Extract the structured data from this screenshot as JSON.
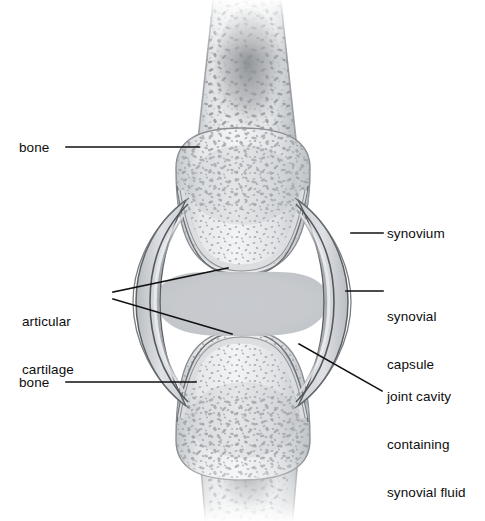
{
  "figure": {
    "background_color": "#ffffff",
    "ink_color": "#111111",
    "bone_fill": "#e8e9ea",
    "bone_outline": "#8d9093",
    "cartilage_fill": "#d9dbdd",
    "cartilage_outline": "#6f7376",
    "capsule_fill": "#cfd2d5",
    "capsule_outline": "#5e6265",
    "cavity_fill": "#c9ccd0",
    "marrow_color": "#8f9295"
  },
  "labels": {
    "bone_top": "bone",
    "bone_bottom": "bone",
    "articular_cartilage_line1": "articular",
    "articular_cartilage_line2": "cartilage",
    "synovium": "synovium",
    "synovial_capsule_line1": "synovial",
    "synovial_capsule_line2": "capsule",
    "joint_cavity_line1": "joint cavity",
    "joint_cavity_line2": "containing",
    "joint_cavity_line3": "synovial fluid"
  },
  "anatomy_parts": [
    "bone",
    "articular cartilage",
    "synovium",
    "synovial capsule",
    "joint cavity containing synovial fluid"
  ],
  "leader_lines": [
    {
      "name": "bone-top-leader",
      "from": [
        66,
        147
      ],
      "to": [
        196,
        147
      ]
    },
    {
      "name": "bone-bottom-leader",
      "from": [
        66,
        382
      ],
      "to": [
        196,
        382
      ]
    },
    {
      "name": "articular-cartilage-leader-upper",
      "from": [
        113,
        293
      ],
      "to": [
        225,
        268
      ]
    },
    {
      "name": "articular-cartilage-leader-lower",
      "from": [
        113,
        300
      ],
      "to": [
        228,
        334
      ]
    },
    {
      "name": "synovium-leader",
      "from": [
        350,
        233
      ],
      "to": [
        383,
        233
      ]
    },
    {
      "name": "synovial-capsule-leader",
      "from": [
        345,
        291
      ],
      "to": [
        383,
        291
      ]
    },
    {
      "name": "joint-cavity-leader",
      "from": [
        300,
        345
      ],
      "to": [
        383,
        392
      ]
    }
  ]
}
